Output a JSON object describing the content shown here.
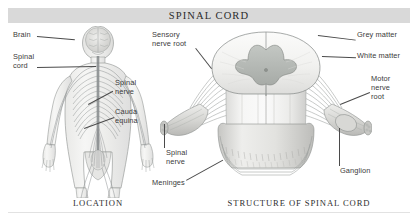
{
  "header": {
    "title": "SPINAL CORD",
    "band_color": "#d9d9d9"
  },
  "figures": [
    {
      "id": "location",
      "caption": "LOCATION",
      "labels": [
        {
          "name": "brain",
          "text": "Brain"
        },
        {
          "name": "spinal-cord",
          "text": "Spinal\ncord"
        },
        {
          "name": "spinal-nerve",
          "text": "Spinal\nnerve"
        },
        {
          "name": "cauda-equina",
          "text": "Cauda\nequina"
        }
      ]
    },
    {
      "id": "structure",
      "caption": "STRUCTURE OF SPINAL CORD",
      "labels": [
        {
          "name": "sensory-nerve-root",
          "text": "Sensory\nnerve root"
        },
        {
          "name": "grey-matter",
          "text": "Grey matter"
        },
        {
          "name": "white-matter",
          "text": "White matter"
        },
        {
          "name": "motor-nerve-root",
          "text": "Motor\nnerve\nroot"
        },
        {
          "name": "ganglion",
          "text": "Ganglion"
        },
        {
          "name": "spinal-nerve",
          "text": "Spinal\nnerve"
        },
        {
          "name": "meninges",
          "text": "Meninges"
        }
      ]
    }
  ],
  "colors": {
    "text": "#3a3a3a",
    "caption": "#2e2e2e",
    "leader": "#4a4a4a",
    "grey_matter": "#b4b8b4",
    "white_matter": "#f2f2f0",
    "anatomy_outline": "#6e7270",
    "background": "#ffffff"
  }
}
